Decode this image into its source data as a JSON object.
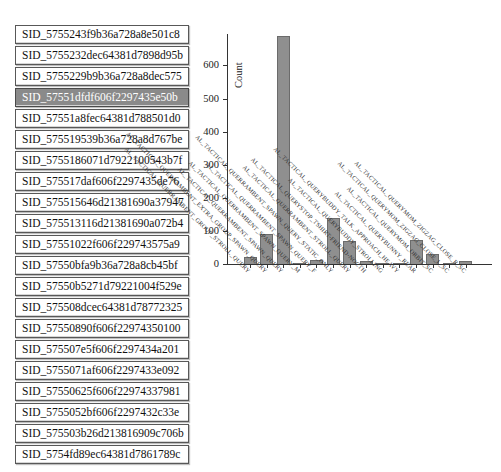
{
  "sidebar": {
    "selected_index": 3,
    "items": [
      {
        "label": "SID_5755243f9b36a728a8e501c8"
      },
      {
        "label": "SID_5755232dec64381d7898d95b"
      },
      {
        "label": "SID_5755229b9b36a728a8dec575"
      },
      {
        "label": "SID_57551dfdf606f2297435e50b"
      },
      {
        "label": "SID_57551a8fec64381d788501d0"
      },
      {
        "label": "SID_575519539b36a728a8d767be"
      },
      {
        "label": "SID_5755186071d7922100543b7f"
      },
      {
        "label": "SID_575517daf606f2297435de76"
      },
      {
        "label": "SID_575515646d21381690a37947"
      },
      {
        "label": "SID_575513116d21381690a072b4"
      },
      {
        "label": "SID_57551022f606f229743575a9"
      },
      {
        "label": "SID_57550bfa9b36a728a8cb45bf"
      },
      {
        "label": "SID_57550b5271d79221004f529e"
      },
      {
        "label": "SID_575508dcec64381d78772325"
      },
      {
        "label": "SID_57550890f606f22974350100"
      },
      {
        "label": "SID_575507e5f606f2297434a201"
      },
      {
        "label": "SID_5755071af606f2297433e092"
      },
      {
        "label": "SID_57550625f606f22974337981"
      },
      {
        "label": "SID_5755052bf606f2297432c33e"
      },
      {
        "label": "SID_575503b26d213816909c706b"
      },
      {
        "label": "SID_5754fd89ec64381d7861789c"
      }
    ]
  },
  "chart_data": {
    "type": "bar",
    "title": "",
    "xlabel": "",
    "ylabel": "Count",
    "ylim": [
      0,
      700
    ],
    "yticks": [
      0,
      100,
      200,
      300,
      400,
      500,
      600
    ],
    "grid": false,
    "legend": null,
    "bar_color": "#8f8f8f",
    "bar_edge_color": "#6b6b6b",
    "categories": [
      "AL_TACTICAL_QUERRAMBENT_GROUP_STROLL_QUERY",
      "AL_TACTICAL_QUERRAMBENT_EXTRA_GROUP_SPAWN_QUERY",
      "AL_TACTICAL_QUERRAMBENT_SPAWN_QUERY",
      "AL_TACTICAL_QUERRAMBENT_SPAWN_QUERY_M",
      "AL_TACTICAL_QUERRAMBENT_SPAWN_QUERY_F",
      "AL_TACTICAL_QUERRAMBENT_SPAWN_QUERY_STATIC_ONLY",
      "AL_TACTICAL_QUERRAMBENT_STROLL_QUERY",
      "AL_TACTICAL_QUERYSTOP_TSHIRT-FRIEND-NOCTH",
      "AL_TACTICAL_QUERYBUDDY_STROLLING",
      "AL_TACTICAL_QUERYBUDDY_TALK_APPROACH_HEAVY",
      "AL_TACTICAL_QUERYBUNNY_REAR",
      "AL_TACTICAL_QUERYMOM_ORBIT_SC",
      "AL_TACTICAL_QUERYMOM_ZIGZAG_CLOSE_L_SC",
      "AL_TACTICAL_QUERYMOM_ZIGZAG_CLOSE_R_SC"
    ],
    "values": [
      20,
      90,
      690,
      4,
      13,
      140,
      70,
      9,
      1,
      2,
      72,
      30,
      2,
      8
    ]
  },
  "colors": {
    "selected_bg": "#8a8a8a",
    "selected_text": "#ffffff",
    "axis": "#333333"
  }
}
